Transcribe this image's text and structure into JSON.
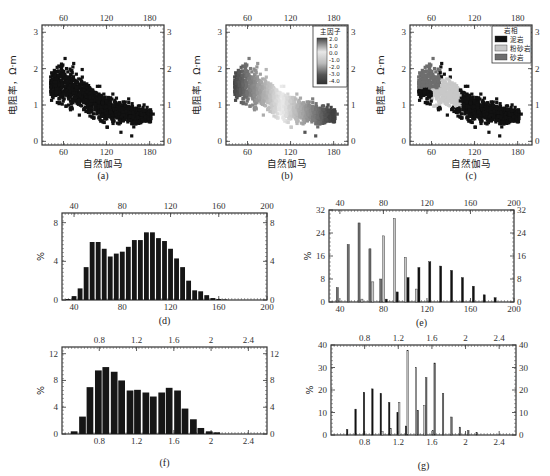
{
  "figure": {
    "panel_labels": [
      "(a)",
      "(b)",
      "(c)",
      "(d)",
      "(e)",
      "(f)",
      "(g)"
    ]
  },
  "colors": {
    "mudstone": "#111111",
    "siltstone": "#c8c8c8",
    "sandstone": "#6e6e6e",
    "hist_bar": "#161616",
    "axis": "#333333"
  },
  "chart_data": [
    {
      "id": "a",
      "type": "scatter",
      "title": "",
      "panel_label": "(a)",
      "xlabel": "自然伽马",
      "ylabel": "电阻率，Ω·m",
      "xlim": [
        30,
        200
      ],
      "ylim": [
        -0.1,
        3.2
      ],
      "xticks": [
        60,
        120,
        180
      ],
      "yticks": [
        0,
        1,
        2,
        3
      ],
      "xticks_top": [
        60,
        120,
        180
      ],
      "yticks_right": [
        0,
        1,
        2,
        3
      ],
      "grid": false,
      "description": "Dense black point cloud with negative trend: resistivity ~1.5–2.5 at GR 45–65, declining to ~0.5–0.8 at GR 150–185",
      "trend": {
        "x": [
          45,
          60,
          80,
          100,
          120,
          140,
          160,
          180
        ],
        "y_center": [
          1.6,
          1.6,
          1.35,
          1.1,
          0.9,
          0.8,
          0.7,
          0.7
        ],
        "y_spread": [
          0.35,
          0.45,
          0.4,
          0.35,
          0.3,
          0.25,
          0.2,
          0.15
        ]
      },
      "outliers": [
        {
          "x": 155,
          "y": 0.15
        },
        {
          "x": 140,
          "y": 0.25
        },
        {
          "x": 185,
          "y": 0.75
        }
      ]
    },
    {
      "id": "b",
      "type": "scatter",
      "panel_label": "(b)",
      "xlabel": "自然伽马",
      "ylabel": "电阻率，Ω·m",
      "xlim": [
        30,
        200
      ],
      "ylim": [
        -0.1,
        3.2
      ],
      "xticks": [
        60,
        120,
        180
      ],
      "yticks": [
        0,
        1,
        2,
        3
      ],
      "colorbar": {
        "title": "主因子",
        "ticks": [
          "2.0",
          "1.0",
          "0.0",
          "-1.0",
          "-2.0",
          "-3.0",
          "-4.0"
        ],
        "range": [
          -4.0,
          2.0
        ]
      },
      "description": "Same point cloud colored by principal factor: dark gray at both ends (low GR/high resistivity and high GR/low resistivity), light gray in the middle"
    },
    {
      "id": "c",
      "type": "scatter",
      "panel_label": "(c)",
      "xlabel": "自然伽马",
      "ylabel": "电阻率，Ω·m",
      "xlim": [
        30,
        200
      ],
      "ylim": [
        -0.1,
        3.2
      ],
      "xticks": [
        60,
        120,
        180
      ],
      "yticks": [
        0,
        1,
        2,
        3
      ],
      "legend": {
        "title": "岩相",
        "position": "upper right",
        "entries": [
          {
            "label": "泥岩",
            "color": "#111111"
          },
          {
            "label": "粉砂岩",
            "color": "#c8c8c8"
          },
          {
            "label": "砂岩",
            "color": "#6e6e6e"
          }
        ]
      },
      "clusters": [
        {
          "name": "砂岩",
          "x_range": [
            40,
            75
          ],
          "y_range": [
            1.4,
            2.4
          ]
        },
        {
          "name": "粉砂岩",
          "x_range": [
            65,
            100
          ],
          "y_range": [
            0.9,
            1.7
          ]
        },
        {
          "name": "泥岩",
          "x_range": [
            75,
            190
          ],
          "y_range": [
            0.4,
            1.5
          ]
        }
      ]
    },
    {
      "id": "d",
      "type": "bar",
      "panel_label": "(d)",
      "xlabel": "",
      "ylabel": "%",
      "xlim": [
        30,
        200
      ],
      "ylim": [
        0,
        9
      ],
      "xticks": [
        40,
        80,
        120,
        160,
        200
      ],
      "yticks": [
        0,
        4,
        8
      ],
      "bin_width": 5,
      "x": [
        35,
        40,
        45,
        50,
        55,
        60,
        65,
        70,
        75,
        80,
        85,
        90,
        95,
        100,
        105,
        110,
        115,
        120,
        125,
        130,
        135,
        140,
        145,
        150,
        155,
        160,
        165,
        170,
        175,
        180,
        185,
        190
      ],
      "values": [
        0.1,
        0.4,
        1.2,
        3.4,
        6.0,
        6.0,
        5.3,
        4.5,
        4.8,
        5.0,
        5.5,
        6.2,
        6.2,
        7.0,
        7.0,
        6.4,
        6.1,
        5.3,
        4.3,
        3.4,
        2.0,
        1.0,
        0.9,
        0.5,
        0.2,
        0.1,
        0.05,
        0.0,
        0.0,
        0.0,
        0.0,
        0.0
      ]
    },
    {
      "id": "e",
      "type": "bar",
      "panel_label": "(e)",
      "ylabel": "%",
      "xlim": [
        30,
        200
      ],
      "ylim": [
        0,
        32
      ],
      "xticks": [
        40,
        80,
        120,
        160,
        200
      ],
      "yticks": [
        0,
        8,
        16,
        24,
        32
      ],
      "categories": [
        40,
        50,
        60,
        70,
        80,
        90,
        100,
        110,
        120,
        130,
        140,
        150,
        160,
        170,
        180
      ],
      "series": [
        {
          "name": "砂岩",
          "color": "#6e6e6e",
          "values": [
            5,
            20,
            27.5,
            18.5,
            8,
            0,
            0,
            0,
            0,
            0,
            0,
            0,
            0,
            0,
            0
          ]
        },
        {
          "name": "粉砂岩",
          "color": "#c8c8c8",
          "values": [
            0,
            0,
            1,
            7,
            23,
            29,
            15.5,
            4.5,
            0,
            0,
            0,
            0,
            0,
            0,
            0
          ]
        },
        {
          "name": "泥岩",
          "color": "#111111",
          "values": [
            0,
            0,
            0,
            0,
            1,
            3.5,
            8.5,
            12,
            14,
            12.5,
            11,
            8.5,
            5.5,
            2.5,
            1.5
          ]
        }
      ]
    },
    {
      "id": "f",
      "type": "bar",
      "panel_label": "(f)",
      "ylabel": "%",
      "xlim": [
        0.4,
        2.6
      ],
      "ylim": [
        0,
        13
      ],
      "xticks": [
        0.8,
        1.2,
        1.6,
        2,
        2.4
      ],
      "yticks": [
        0,
        4,
        8,
        12
      ],
      "bin_width": 0.085,
      "x": [
        0.53,
        0.62,
        0.7,
        0.79,
        0.87,
        0.96,
        1.04,
        1.13,
        1.21,
        1.3,
        1.38,
        1.47,
        1.55,
        1.64,
        1.72,
        1.81,
        1.89,
        1.98,
        2.06
      ],
      "values": [
        0.4,
        2.6,
        7.0,
        9.5,
        10.0,
        9.3,
        8.0,
        6.5,
        6.6,
        6.2,
        5.6,
        6.2,
        6.9,
        6.5,
        3.8,
        2.2,
        0.9,
        0.4,
        0.25
      ]
    },
    {
      "id": "g",
      "type": "bar",
      "panel_label": "(g)",
      "ylabel": "%",
      "xlim": [
        0.4,
        2.6
      ],
      "ylim": [
        0,
        40
      ],
      "xticks": [
        0.8,
        1.2,
        1.6,
        2,
        2.4
      ],
      "yticks": [
        0,
        10,
        20,
        30,
        40
      ],
      "categories": [
        0.6,
        0.7,
        0.8,
        0.9,
        1.0,
        1.1,
        1.2,
        1.3,
        1.4,
        1.5,
        1.6,
        1.7,
        1.8,
        1.9,
        2.0,
        2.1
      ],
      "series": [
        {
          "name": "泥岩",
          "color": "#111111",
          "values": [
            2.5,
            11.5,
            19,
            20.5,
            18.5,
            14.5,
            10,
            4,
            0,
            0,
            0,
            0,
            0,
            0,
            0,
            0
          ]
        },
        {
          "name": "粉砂岩",
          "color": "#c8c8c8",
          "values": [
            0,
            0,
            0,
            0,
            1.5,
            3,
            14.5,
            37.5,
            30,
            13,
            2,
            0,
            0,
            0,
            0,
            0
          ]
        },
        {
          "name": "砂岩",
          "color": "#6e6e6e",
          "values": [
            0,
            0,
            0,
            0,
            0,
            0,
            0,
            0,
            11,
            25.5,
            32,
            18.5,
            8,
            3.5,
            2,
            1
          ]
        }
      ]
    }
  ]
}
